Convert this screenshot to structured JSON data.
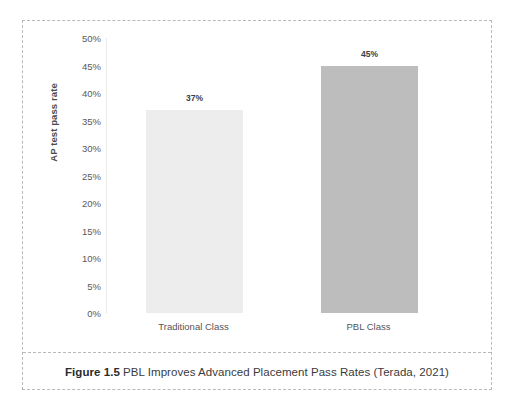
{
  "figure": {
    "caption_label": "Figure 1.5",
    "caption_text": "PBL Improves Advanced Placement Pass Rates (Terada, 2021)"
  },
  "chart_data": {
    "type": "bar",
    "title": "",
    "subtitle": "",
    "xlabel": "",
    "ylabel": "AP test pass rate",
    "categories": [
      "Traditional Class",
      "PBL Class"
    ],
    "values": [
      37,
      45
    ],
    "value_labels": [
      "37%",
      "45%"
    ],
    "bar_colors": [
      "#ededed",
      "#bdbdbd"
    ],
    "ylim": [
      0,
      50
    ],
    "ytick_values": [
      50,
      45,
      40,
      35,
      30,
      25,
      20,
      15,
      10,
      5,
      0
    ],
    "ytick_labels": [
      "50%",
      "45%",
      "40%",
      "35%",
      "30%",
      "25%",
      "20%",
      "15%",
      "10%",
      "5%",
      "0%"
    ],
    "grid": false,
    "legend": "none",
    "axis_color": "#e9e9e9",
    "tick_label_color": "#59595b"
  }
}
